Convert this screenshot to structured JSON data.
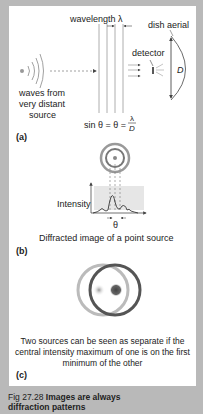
{
  "figure": {
    "panel_a": {
      "label": "(a)",
      "wavelength_label": "wavelength",
      "lambda_symbol": "λ",
      "dish_label": "dish aerial",
      "detector_label": "detector",
      "diameter_symbol": "D",
      "source_label_line1": "waves from",
      "source_label_line2": "very distant",
      "source_label_line3": "source",
      "formula_left": "sin θ = θ =",
      "formula_num": "λ",
      "formula_den": "D"
    },
    "panel_b": {
      "label": "(b)",
      "axis_label": "Intensity",
      "angle_symbol": "θ",
      "caption": "Diffracted image of a point source"
    },
    "panel_c": {
      "label": "(c)",
      "caption_line1": "Two sources can be seen as separate if the",
      "caption_line2": "central intensity maximum of one is on the first",
      "caption_line3": "minimum of the other"
    },
    "caption": {
      "prefix": "Fig 27.28",
      "title_line1": "Images are always",
      "title_line2": "diffraction patterns"
    }
  },
  "colors": {
    "border": "#b9b9b9",
    "panel": "#ffffff",
    "line": "#333333",
    "shade": "#e6e6e6"
  }
}
